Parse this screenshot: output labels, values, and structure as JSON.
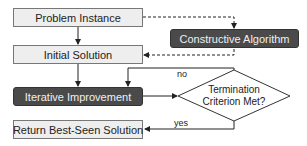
{
  "nodes": {
    "problem_instance": "Problem Instance",
    "initial_solution": "Initial Solution",
    "constructive_algorithm": "Constructive Algorithm",
    "iterative_improvement": "Iterative Improvement",
    "termination_line1": "Termination",
    "termination_line2": "Criterion Met?",
    "return_best": "Return Best-Seen Solution"
  },
  "edges": {
    "no_label": "no",
    "yes_label": "yes"
  },
  "colors": {
    "light_box": "#eeeeee",
    "dark_box": "#4a4a4a",
    "line": "#222222"
  }
}
